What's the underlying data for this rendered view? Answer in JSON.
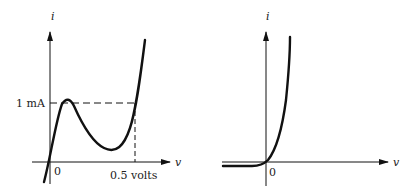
{
  "figures": [
    {
      "name": "tunnel-diode-characteristic",
      "y_axis_label": "i",
      "x_axis_label": "v",
      "origin_label": "0",
      "current_marker_label": "1 mA",
      "voltage_marker_label": "0.5 volts"
    },
    {
      "name": "diode-exponential-characteristic",
      "y_axis_label": "i",
      "x_axis_label": "v",
      "origin_label": "0"
    }
  ],
  "colors": {
    "stroke": "#111111",
    "background": "#ffffff"
  }
}
